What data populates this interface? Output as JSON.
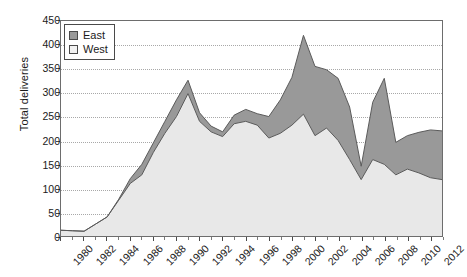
{
  "chart_data": {
    "type": "area",
    "stacked": true,
    "title": "",
    "subtitle": "",
    "xlabel": "",
    "ylabel": "Total deliveries",
    "ylim": [
      0,
      450
    ],
    "ytick_step": 50,
    "yticks": [
      0,
      50,
      100,
      150,
      200,
      250,
      300,
      350,
      400,
      450
    ],
    "xlim": [
      1980,
      2013
    ],
    "xticks": [
      1980,
      1982,
      1984,
      1986,
      1988,
      1990,
      1992,
      1994,
      1996,
      1998,
      2000,
      2002,
      2004,
      2006,
      2008,
      2010,
      2012
    ],
    "xtick_labels": [
      "1980",
      "1982",
      "1984",
      "1986",
      "1988",
      "1990",
      "1992",
      "1994",
      "1996",
      "1998",
      "2000",
      "2002",
      "2004",
      "2006",
      "2008",
      "2010",
      "2012"
    ],
    "grid": "horizontal-dotted",
    "legend_position": "top-left",
    "x": [
      1980,
      1981,
      1982,
      1983,
      1984,
      1985,
      1986,
      1987,
      1988,
      1989,
      1990,
      1991,
      1992,
      1993,
      1994,
      1995,
      1996,
      1997,
      1998,
      1999,
      2000,
      2001,
      2002,
      2003,
      2004,
      2005,
      2006,
      2007,
      2008,
      2009,
      2010,
      2011,
      2012,
      2013
    ],
    "series": [
      {
        "name": "West",
        "color": "#e8e8e8",
        "values": [
          12,
          11,
          10,
          25,
          40,
          75,
          110,
          128,
          175,
          215,
          250,
          298,
          240,
          218,
          208,
          235,
          240,
          232,
          205,
          215,
          232,
          255,
          210,
          226,
          200,
          160,
          118,
          160,
          150,
          128,
          140,
          132,
          122,
          118
        ]
      },
      {
        "name": "East",
        "color": "#999999",
        "values": [
          0,
          0,
          0,
          0,
          0,
          2,
          10,
          22,
          20,
          25,
          35,
          28,
          18,
          12,
          10,
          18,
          25,
          24,
          45,
          70,
          100,
          165,
          145,
          122,
          130,
          110,
          28,
          120,
          180,
          68,
          70,
          85,
          100,
          102
        ]
      }
    ],
    "totals": [
      12,
      11,
      10,
      25,
      40,
      77,
      120,
      150,
      195,
      240,
      285,
      326,
      258,
      230,
      218,
      253,
      265,
      256,
      250,
      285,
      332,
      420,
      355,
      348,
      330,
      270,
      146,
      280,
      330,
      196,
      210,
      217,
      222,
      220
    ]
  },
  "legend": {
    "items": [
      {
        "label": "East",
        "color": "#999999"
      },
      {
        "label": "West",
        "color": "#f2f2f2"
      }
    ]
  },
  "axes": {
    "y_title": "Total deliveries"
  }
}
